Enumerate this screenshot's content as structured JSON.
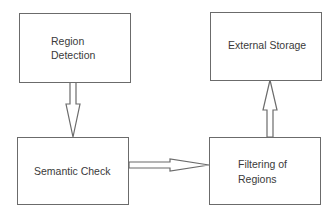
{
  "diagram": {
    "type": "flowchart",
    "nodes": [
      {
        "id": "region_detection",
        "label_lines": [
          "Region",
          "Detection"
        ]
      },
      {
        "id": "external_storage",
        "label_lines": [
          "External Storage"
        ]
      },
      {
        "id": "semantic_check",
        "label_lines": [
          "Semantic Check"
        ]
      },
      {
        "id": "filtering_of_regions",
        "label_lines": [
          "Filtering of",
          "Regions"
        ]
      }
    ],
    "edges": [
      {
        "from": "region_detection",
        "to": "semantic_check",
        "direction": "down"
      },
      {
        "from": "semantic_check",
        "to": "filtering_of_regions",
        "direction": "right"
      },
      {
        "from": "filtering_of_regions",
        "to": "external_storage",
        "direction": "up"
      }
    ],
    "colors": {
      "stroke": "#6b6b6b",
      "text": "#3a3a3a",
      "background": "#ffffff"
    }
  }
}
